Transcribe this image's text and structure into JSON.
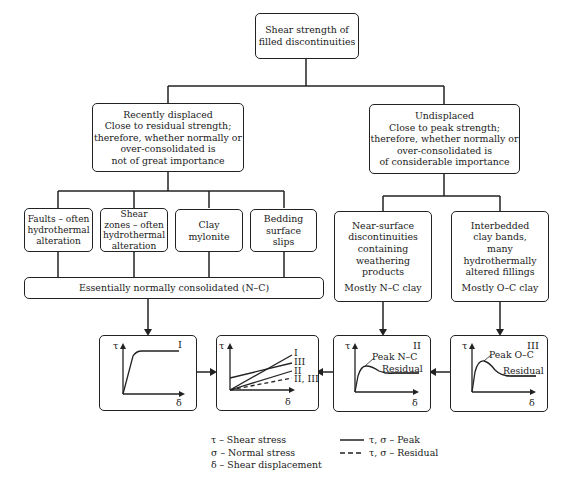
{
  "root": {
    "lines": [
      "Shear strength of",
      "filled discontinuities"
    ]
  },
  "left_branch": {
    "lines": [
      "Recently displaced",
      "Close to residual strength;",
      "therefore, whether normally or",
      "over-consolidated is",
      "not of great importance"
    ]
  },
  "right_branch": {
    "lines": [
      "Undisplaced",
      "Close to peak strength;",
      "therefore, whether normally or",
      "over-consolidated is",
      "of considerable importance"
    ]
  },
  "left_children": [
    {
      "lines": [
        "Faults – often",
        "hydrothermal",
        "alteration"
      ]
    },
    {
      "lines": [
        "Shear",
        "zones – often",
        "hydrothermal",
        "alteration"
      ]
    },
    {
      "lines": [
        "Clay",
        "mylonite"
      ]
    },
    {
      "lines": [
        "Bedding",
        "surface",
        "slips"
      ]
    }
  ],
  "nc_bar": "Essentially normally consolidated (N–C)",
  "right_children": [
    {
      "lines": [
        "Near-surface",
        "discontinuities",
        "containing",
        "weathering",
        "products"
      ],
      "footer": "Mostly N–C clay"
    },
    {
      "lines": [
        "Interbedded",
        "clay bands,",
        "many",
        "hydrothermally",
        "altered fillings"
      ],
      "footer": "Mostly O–C clay"
    }
  ],
  "charts": {
    "axis_y": "τ",
    "axis_x": "δ",
    "chart_I": {
      "label": "I"
    },
    "chart_combined": {
      "labels": [
        "I",
        "III",
        "II",
        "II, III"
      ]
    },
    "chart_II": {
      "label": "II",
      "peak": "Peak N–C",
      "residual": "Residual"
    },
    "chart_III": {
      "label": "III",
      "peak": "Peak O–C",
      "residual": "Residual"
    }
  },
  "legend": {
    "symbols": [
      "τ – Shear stress",
      "σ – Normal stress",
      "δ – Shear displacement"
    ],
    "lines": [
      "τ, σ – Peak",
      "τ, σ – Residual"
    ]
  }
}
